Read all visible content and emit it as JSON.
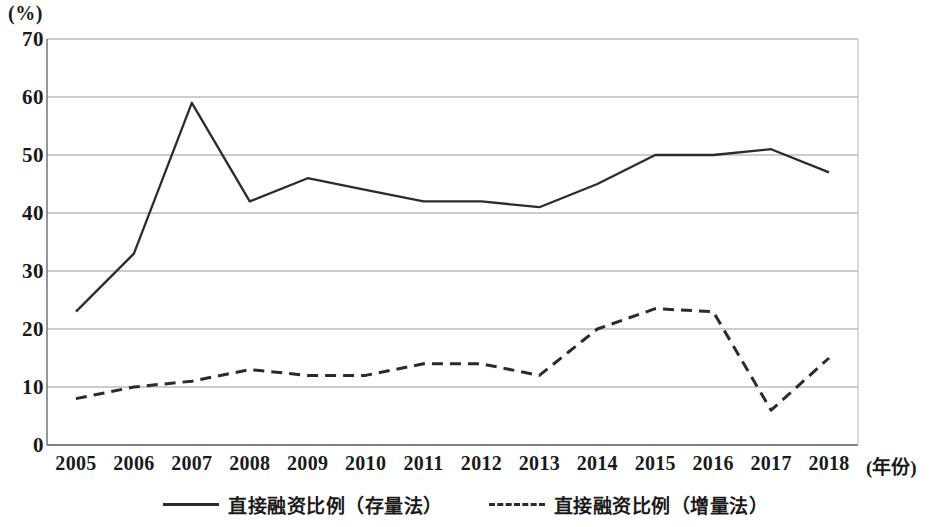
{
  "chart_data": {
    "type": "line",
    "title": "",
    "subtitle": "",
    "unit_label": "(%)",
    "xlabel": "(年份)",
    "ylabel": "(%)",
    "categories": [
      "2005",
      "2006",
      "2007",
      "2008",
      "2009",
      "2010",
      "2011",
      "2012",
      "2013",
      "2014",
      "2015",
      "2016",
      "2017",
      "2018"
    ],
    "ylim": [
      0,
      70
    ],
    "ytick_values": [
      "0",
      "10",
      "20",
      "30",
      "40",
      "50",
      "60",
      "70"
    ],
    "grid": true,
    "legend_position": "bottom",
    "series": [
      {
        "name": "直接融资比例（存量法）",
        "style": "solid",
        "color": "#2b2b2b",
        "values": [
          23,
          33,
          59,
          42,
          46,
          44,
          42,
          42,
          41,
          45,
          50,
          50,
          51,
          47
        ]
      },
      {
        "name": "直接融资比例（增量法）",
        "style": "dashed",
        "color": "#2b2b2b",
        "values": [
          8,
          10,
          11,
          13,
          12,
          12,
          14,
          14,
          12,
          20,
          23.5,
          23,
          6,
          15
        ]
      }
    ]
  },
  "axes": {
    "y_unit": "(%)",
    "x_title": "(年份)"
  },
  "legend": {
    "items": [
      {
        "label": "直接融资比例（存量法）",
        "style": "solid"
      },
      {
        "label": "直接融资比例（增量法）",
        "style": "dashed"
      }
    ]
  }
}
